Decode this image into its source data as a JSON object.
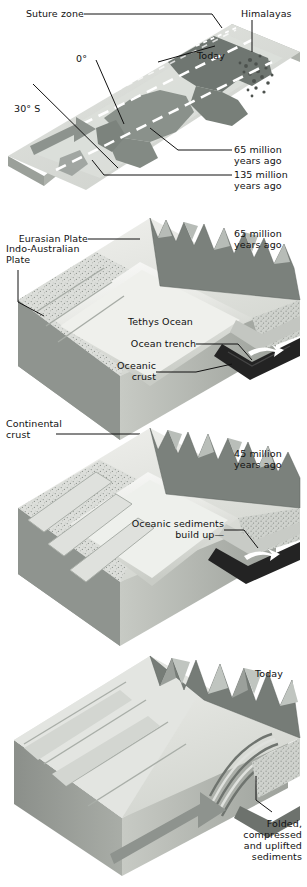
{
  "figure": {
    "panel_count": 4
  },
  "map_panel": {
    "name": "paleogeographic-map",
    "labels": {
      "suture_zone": "Suture zone",
      "himalayas": "Himalayas",
      "today": "Today",
      "equator": "0°",
      "lat30s": "30° S",
      "ma65": "65 million\nyears ago",
      "ma135": "135 million\nyears ago"
    }
  },
  "block1": {
    "name": "block-65-million-years-ago",
    "age": "65 million\nyears ago",
    "labels": {
      "eurasian_plate": "Eurasian Plate",
      "indo_australian_plate": "Indo-Australian\nPlate",
      "tethys_ocean": "Tethys Ocean",
      "ocean_trench": "Ocean trench",
      "oceanic_crust": "Oceanic\ncrust",
      "continental_crust": "Continental\ncrust"
    }
  },
  "block2": {
    "name": "block-45-million-years-ago",
    "age": "45 million\nyears ago",
    "labels": {
      "oceanic_sediments": "Oceanic sediments\nbuild up—"
    }
  },
  "block3": {
    "name": "block-today",
    "age": "Today",
    "labels": {
      "folded_sediments": "Folded,\ncompressed\nand uplifted\nsediments"
    }
  },
  "colors": {
    "ink": "#111111",
    "paper": "#ffffff",
    "ocean_pale": "#d9dcd9",
    "land_mid": "#9aa09b",
    "land_dark": "#6f7671",
    "crust_light": "#e6e7e4",
    "crust_mid": "#b9bcb7",
    "crust_dark": "#8d918c",
    "oceanic_crust_black": "#232323",
    "mountain_shadow": "#6c716d"
  }
}
